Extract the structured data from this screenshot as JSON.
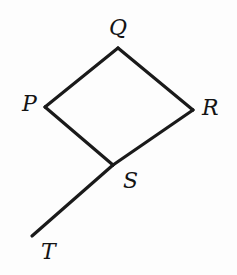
{
  "figure": {
    "background_color": "#fdfdfd",
    "stroke_color": "#1a1a1a",
    "label_color": "#141414",
    "stroke_width": 3.2,
    "canvas": {
      "width": 237,
      "height": 275
    },
    "labels": {
      "p": "P",
      "q": "Q",
      "r": "R",
      "s": "S",
      "t": "T"
    }
  },
  "chart_data": {
    "type": "diagram",
    "points": [
      {
        "name": "P",
        "x": 45,
        "y": 107,
        "label": "P",
        "label_x": 22,
        "label_y": 93
      },
      {
        "name": "Q",
        "x": 118,
        "y": 48,
        "label": "Q",
        "label_x": 109,
        "label_y": 17
      },
      {
        "name": "R",
        "x": 193,
        "y": 110,
        "label": "R",
        "label_x": 202,
        "label_y": 97
      },
      {
        "name": "S",
        "x": 113,
        "y": 165,
        "label": "S",
        "label_x": 123,
        "label_y": 170
      },
      {
        "name": "T",
        "x": 32,
        "y": 236,
        "label": "T",
        "label_x": 41,
        "label_y": 241
      }
    ],
    "segments": [
      {
        "name": "PQ",
        "from": "P",
        "to": "Q"
      },
      {
        "name": "QR",
        "from": "Q",
        "to": "R"
      },
      {
        "name": "RS",
        "from": "R",
        "to": "S"
      },
      {
        "name": "SP",
        "from": "S",
        "to": "P"
      },
      {
        "name": "ST",
        "from": "S",
        "to": "T"
      }
    ],
    "xlabel": "",
    "ylabel": "",
    "grid": false,
    "legend": false
  }
}
